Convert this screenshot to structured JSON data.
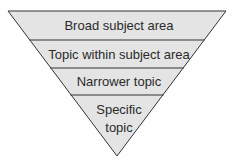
{
  "diagram": {
    "type": "inverted-pyramid",
    "fill_color": "#e4e4e4",
    "stroke_color": "#333333",
    "levels": [
      {
        "label": "Broad subject area"
      },
      {
        "label": "Topic within subject area"
      },
      {
        "label": "Narrower topic"
      },
      {
        "label_line1": "Specific",
        "label_line2": "topic"
      }
    ]
  }
}
